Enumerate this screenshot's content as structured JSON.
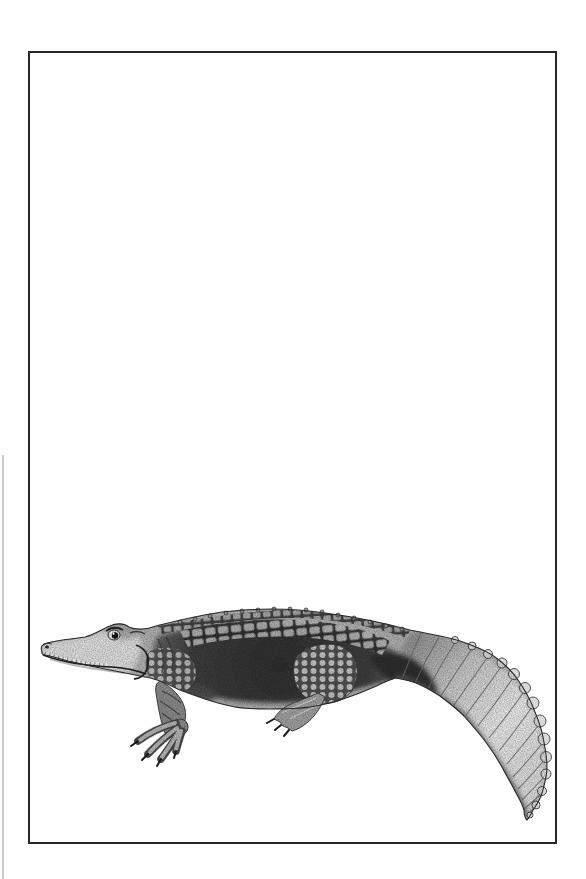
{
  "window": {
    "width": 586,
    "height": 879
  },
  "page": {
    "background_color": "#fefefe",
    "frame_border_color": "#272727",
    "edge_shadow_color": "#bdbdbd"
  },
  "illustration": {
    "subject": "alligator",
    "style": "black-and-white pencil engraving",
    "facing": "left",
    "palette": {
      "outline": "#2c2c2c",
      "base": "#b0b0b0",
      "flank_dark": "#383838",
      "head_light": "#dedede",
      "tail_light": "#e2e2e2",
      "scute_light": "#b8b8b8",
      "claw_dark": "#1a1a1a"
    }
  }
}
